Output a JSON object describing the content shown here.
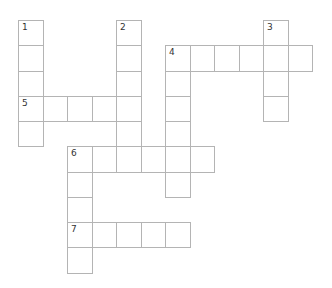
{
  "puzzle": {
    "type": "crossword",
    "grid": {
      "origin_x": 18,
      "origin_y": 20,
      "cell_w": 24.5,
      "cell_h": 25.25,
      "border_color": "#b4b4b4"
    },
    "entries": [
      {
        "number": "1",
        "direction": "down",
        "col": 0,
        "row": 0,
        "length": 5
      },
      {
        "number": "2",
        "direction": "down",
        "col": 4,
        "row": 0,
        "length": 6
      },
      {
        "number": "3",
        "direction": "down",
        "col": 10,
        "row": 0,
        "length": 4
      },
      {
        "number": "4",
        "direction": "across",
        "col": 6,
        "row": 1,
        "length": 6
      },
      {
        "number": "4",
        "direction": "down",
        "col": 6,
        "row": 1,
        "length": 6
      },
      {
        "number": "5",
        "direction": "across",
        "col": 0,
        "row": 3,
        "length": 5
      },
      {
        "number": "6",
        "direction": "across",
        "col": 2,
        "row": 5,
        "length": 6
      },
      {
        "number": "6",
        "direction": "down",
        "col": 2,
        "row": 5,
        "length": 5
      },
      {
        "number": "7",
        "direction": "across",
        "col": 2,
        "row": 8,
        "length": 5
      }
    ]
  }
}
